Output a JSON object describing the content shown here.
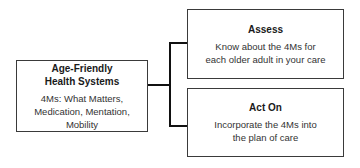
{
  "diagram": {
    "root": {
      "title": "Age-Friendly Health Systems",
      "title_line1": "Age-Friendly",
      "title_line2": "Health Systems",
      "body": "4Ms: What Matters, Medication, Mentation, Mobility",
      "body_line1": "4Ms: What Matters,",
      "body_line2": "Medication, Mentation,",
      "body_line3": "Mobility"
    },
    "children": [
      {
        "title": "Assess",
        "body": "Know about the 4Ms for each older adult in your care",
        "body_line1": "Know about the 4Ms for",
        "body_line2": "each older adult in your care"
      },
      {
        "title": "Act On",
        "body": "Incorporate the 4Ms into the plan of care",
        "body_line1": "Incorporate the 4Ms into",
        "body_line2": "the plan of care"
      }
    ],
    "colors": {
      "border": "#3a3a3a",
      "connector": "#111111",
      "text": "#222222",
      "background": "#ffffff"
    }
  }
}
